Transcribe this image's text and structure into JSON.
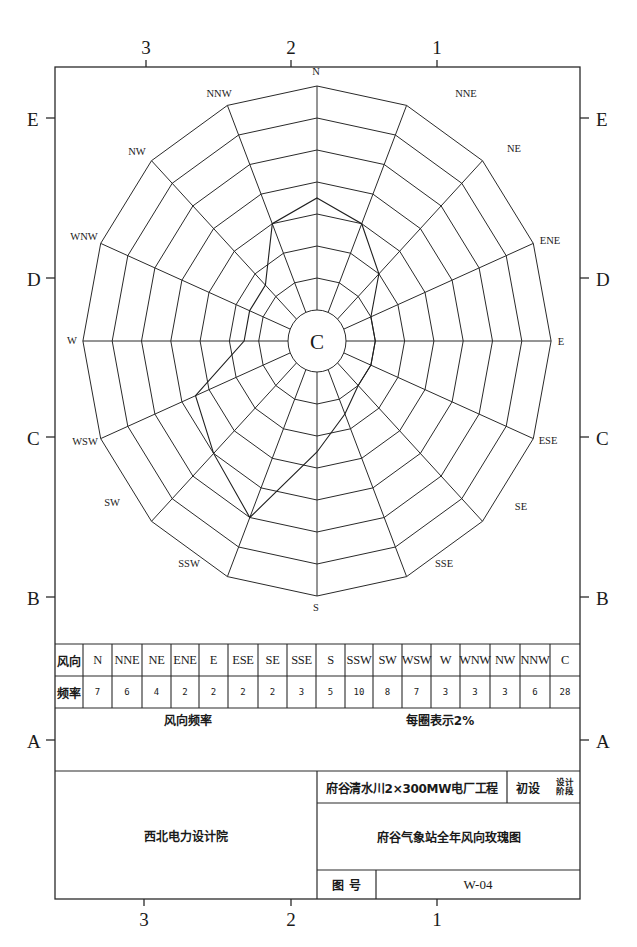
{
  "frame": {
    "column_markers": [
      "3",
      "2",
      "1"
    ],
    "row_markers": [
      "E",
      "D",
      "C",
      "B",
      "A"
    ]
  },
  "chart_data": {
    "type": "wind-rose",
    "title": "府谷气象站全年风向玫瑰图",
    "center_label": "C",
    "ring_interval_percent": 2,
    "ring_count": 8,
    "directions": [
      "N",
      "NNE",
      "NE",
      "ENE",
      "E",
      "ESE",
      "SE",
      "SSE",
      "S",
      "SSW",
      "SW",
      "WSW",
      "W",
      "WNW",
      "NW",
      "NNW"
    ],
    "values": [
      7,
      6,
      4,
      2,
      2,
      2,
      2,
      3,
      5,
      10,
      8,
      7,
      3,
      3,
      3,
      6
    ],
    "calm_percent": 28,
    "legend_left": "风向频率",
    "legend_right": "每圈表示2%"
  },
  "table": {
    "row_header_direction": "风向",
    "row_header_frequency": "频率",
    "columns": [
      "N",
      "NNE",
      "NE",
      "ENE",
      "E",
      "ESE",
      "SE",
      "SSE",
      "S",
      "SSW",
      "SW",
      "WSW",
      "W",
      "WNW",
      "NW",
      "NNW",
      "C"
    ],
    "frequencies": [
      "7",
      "6",
      "4",
      "2",
      "2",
      "2",
      "2",
      "3",
      "5",
      "10",
      "8",
      "7",
      "3",
      "3",
      "3",
      "6",
      "28"
    ],
    "caption_left": "风向频率",
    "caption_right": "每圈表示2%"
  },
  "title_block": {
    "organization": "西北电力设计院",
    "project": "府谷清水川2×300MW电厂工程",
    "stage_value": "初设",
    "stage_label_line1": "设计",
    "stage_label_line2": "阶段",
    "drawing_title": "府谷气象站全年风向玫瑰图",
    "drawing_no_label": "图 号",
    "drawing_no": "W-04"
  }
}
